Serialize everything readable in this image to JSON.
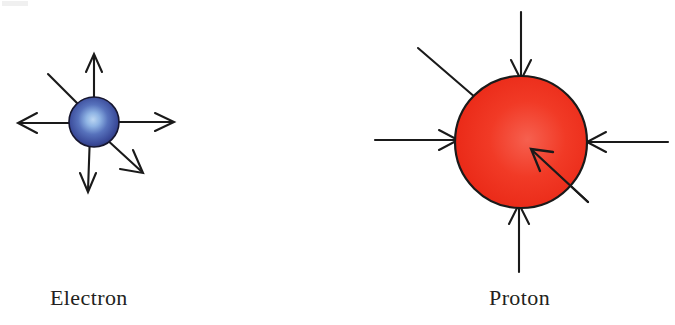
{
  "figure": {
    "background_color": "#ffffff",
    "width": 675,
    "height": 325
  },
  "particles": [
    {
      "id": "electron",
      "label": "Electron",
      "charge": "negative",
      "shape": "sphere",
      "fill_style": "radial-gradient",
      "colors": {
        "highlight": "#a8c8ee",
        "mid": "#4a62ad",
        "edge": "#2b3570",
        "outline": "#14142e"
      },
      "center": {
        "x": 94,
        "y": 122
      },
      "radius": 25,
      "field_direction": "outward",
      "label_position": {
        "x": 50,
        "y": 285
      },
      "arrows": [
        {
          "name": "arrow-up",
          "angle_deg": 270,
          "length": 66,
          "head": true
        },
        {
          "name": "arrow-right",
          "angle_deg": 0,
          "length": 74,
          "head": true
        },
        {
          "name": "arrow-down",
          "angle_deg": 90,
          "length": 62,
          "head": true
        },
        {
          "name": "arrow-left",
          "angle_deg": 180,
          "length": 76,
          "head": true
        },
        {
          "name": "arrow-down-right",
          "angle_deg": 42,
          "length": 66,
          "head": true
        },
        {
          "name": "line-up-left",
          "angle_deg": 215,
          "length": 56,
          "head": false
        }
      ]
    },
    {
      "id": "proton",
      "label": "Proton",
      "charge": "positive",
      "shape": "circle",
      "fill_style": "solid",
      "colors": {
        "highlight": "#f4584a",
        "mid": "#ee2a18",
        "edge": "#e01f10",
        "outline": "#1a1a1a"
      },
      "center": {
        "x": 521,
        "y": 142
      },
      "radius": 66,
      "field_direction": "inward",
      "label_position": {
        "x": 489,
        "y": 285
      },
      "arrows": [
        {
          "name": "arrow-from-top",
          "angle_deg": 270,
          "length": 66,
          "head": true
        },
        {
          "name": "arrow-from-right",
          "angle_deg": 0,
          "length": 80,
          "head": true
        },
        {
          "name": "arrow-from-bottom",
          "angle_deg": 90,
          "length": 70,
          "head": true
        },
        {
          "name": "arrow-from-left",
          "angle_deg": 180,
          "length": 80,
          "head": true
        },
        {
          "name": "arrow-from-lower-right",
          "angle_deg": 42,
          "length": 95,
          "head": true
        },
        {
          "name": "line-upper-left",
          "angle_deg": 215,
          "length": 75,
          "head": false
        }
      ]
    }
  ],
  "stroke": {
    "color": "#1a1a1a",
    "width": 2.1
  }
}
